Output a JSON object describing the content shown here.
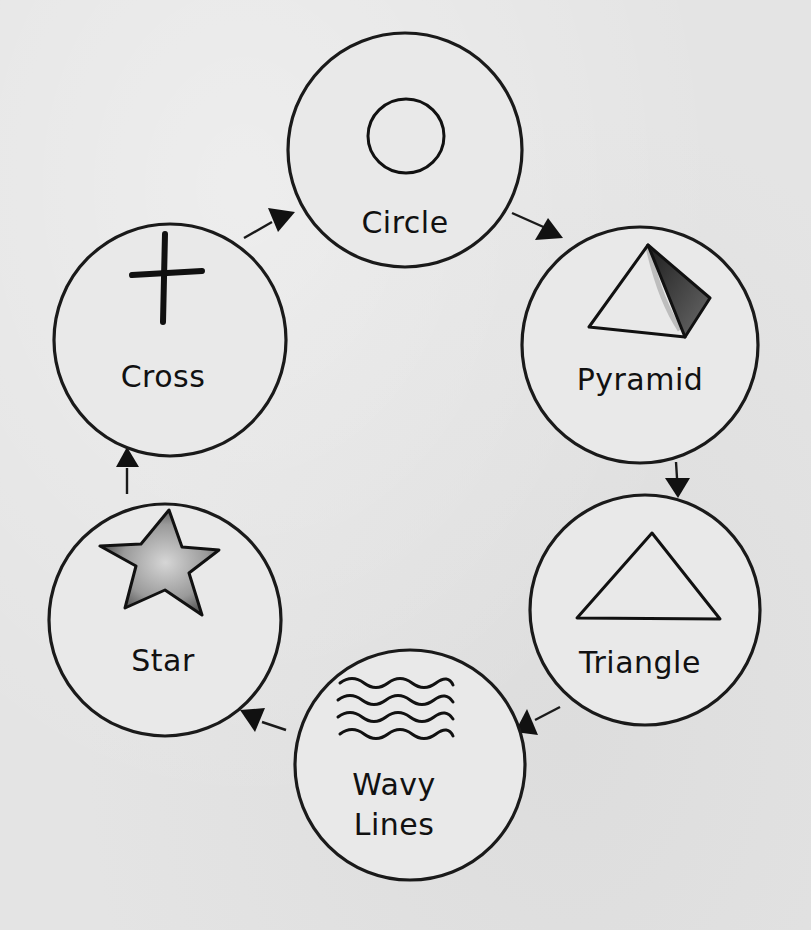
{
  "diagram": {
    "type": "cycle",
    "direction": "clockwise",
    "colors": {
      "background": "#e4e4e4",
      "ink": "#111111",
      "shade_dark": "#3a3a3a",
      "shade_star": "#8a8a8a"
    },
    "nodes": [
      {
        "id": "circle",
        "label": "Circle",
        "icon": "circle-icon",
        "cx": 405,
        "cy": 150,
        "r": 117
      },
      {
        "id": "pyramid",
        "label": "Pyramid",
        "icon": "pyramid-icon",
        "cx": 640,
        "cy": 345,
        "r": 118
      },
      {
        "id": "triangle",
        "label": "Triangle",
        "icon": "triangle-icon",
        "cx": 645,
        "cy": 610,
        "r": 115
      },
      {
        "id": "wavy",
        "label_line1": "Wavy",
        "label_line2": "Lines",
        "icon": "wavy-lines-icon",
        "cx": 410,
        "cy": 765,
        "r": 115
      },
      {
        "id": "star",
        "label": "Star",
        "icon": "star-icon",
        "cx": 165,
        "cy": 620,
        "r": 116
      },
      {
        "id": "cross",
        "label": "Cross",
        "icon": "cross-icon",
        "cx": 170,
        "cy": 340,
        "r": 116
      }
    ],
    "edges": [
      {
        "from": "Circle",
        "to": "Pyramid"
      },
      {
        "from": "Pyramid",
        "to": "Triangle"
      },
      {
        "from": "Triangle",
        "to": "Wavy Lines"
      },
      {
        "from": "Wavy Lines",
        "to": "Star"
      },
      {
        "from": "Star",
        "to": "Cross"
      },
      {
        "from": "Cross",
        "to": "Circle"
      }
    ]
  }
}
